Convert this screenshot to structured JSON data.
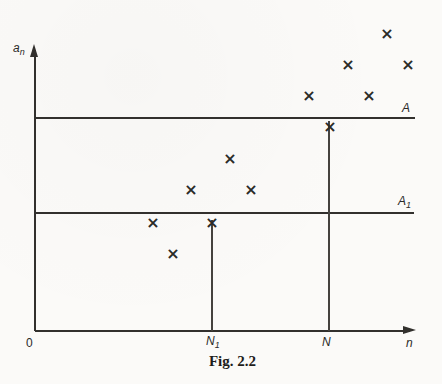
{
  "figure": {
    "caption": "Fig. 2.2",
    "y_axis_label": {
      "base": "a",
      "sub": "n"
    },
    "x_axis_label": "n",
    "origin_label": "0",
    "upper_line_label": "A",
    "lower_line_label": {
      "base": "A",
      "sub": "1"
    },
    "n1_label": {
      "base": "N",
      "sub": "1"
    },
    "n_label": "N",
    "ink_color": "#32302d",
    "background": "#fbfaf8"
  },
  "chart_data": {
    "type": "scatter",
    "title": "Fig. 2.2",
    "xlabel": "n",
    "ylabel": "a_n",
    "marker": "×",
    "axes_px": {
      "origin": [
        35,
        331
      ],
      "x_end": 416,
      "y_end": 44
    },
    "h_lines": [
      {
        "label": "A",
        "y_px": 118,
        "x_from_px": 35,
        "x_to_px": 415
      },
      {
        "label": "A1",
        "y_px": 213,
        "x_from_px": 35,
        "x_to_px": 414
      }
    ],
    "v_lines": [
      {
        "label": "N1",
        "x_px": 212,
        "y_top_px": 220
      },
      {
        "label": "N",
        "x_px": 329,
        "y_top_px": 121
      }
    ],
    "points_px": [
      [
        387,
        34
      ],
      [
        348,
        65
      ],
      [
        408,
        65
      ],
      [
        309,
        96
      ],
      [
        369,
        96
      ],
      [
        330,
        127
      ],
      [
        230,
        159
      ],
      [
        191,
        190
      ],
      [
        251,
        190
      ],
      [
        153,
        223
      ],
      [
        212,
        223
      ],
      [
        173,
        254
      ]
    ]
  }
}
